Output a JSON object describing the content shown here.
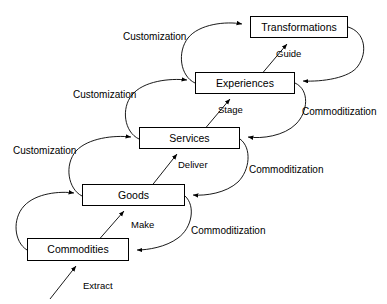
{
  "diagram": {
    "type": "staircase-flow",
    "stroke_color": "#000000",
    "background_color": "#ffffff",
    "nodes": [
      {
        "id": "commodities",
        "label": "Commodities",
        "x": 27,
        "y": 238,
        "width": 102,
        "height": 23
      },
      {
        "id": "goods",
        "label": "Goods",
        "x": 82,
        "y": 184,
        "width": 103,
        "height": 22
      },
      {
        "id": "services",
        "label": "Services",
        "x": 139,
        "y": 127,
        "width": 101,
        "height": 22
      },
      {
        "id": "experiences",
        "label": "Experiences",
        "x": 195,
        "y": 72,
        "width": 100,
        "height": 22
      },
      {
        "id": "transformations",
        "label": "Transformations",
        "x": 250,
        "y": 16,
        "width": 98,
        "height": 22
      }
    ],
    "edge_labels": {
      "customization": [
        {
          "text": "Customization",
          "x": 123,
          "y": 32,
          "from": "experiences",
          "to": "transformations"
        },
        {
          "text": "Customization",
          "x": 73,
          "y": 90,
          "from": "services",
          "to": "experiences"
        },
        {
          "text": "Customization",
          "x": 13,
          "y": 146,
          "from": "goods",
          "to": "services"
        }
      ],
      "commoditization": [
        {
          "text": "Commoditization",
          "x": 302,
          "y": 107,
          "from": "transformations",
          "to": "experiences"
        },
        {
          "text": "Commoditization",
          "x": 249,
          "y": 165,
          "from": "experiences",
          "to": "services"
        },
        {
          "text": "Commoditization",
          "x": 191,
          "y": 226,
          "from": "services",
          "to": "goods"
        }
      ],
      "verbs": [
        {
          "text": "Extract",
          "x": 83,
          "y": 281,
          "to": "commodities"
        },
        {
          "text": "Make",
          "x": 131,
          "y": 220,
          "from": "commodities",
          "to": "goods"
        },
        {
          "text": "Deliver",
          "x": 178,
          "y": 160,
          "from": "goods",
          "to": "services"
        },
        {
          "text": "Stage",
          "x": 218,
          "y": 105,
          "from": "services",
          "to": "experiences"
        },
        {
          "text": "Guide",
          "x": 276,
          "y": 49,
          "from": "experiences",
          "to": "transformations"
        }
      ]
    }
  }
}
